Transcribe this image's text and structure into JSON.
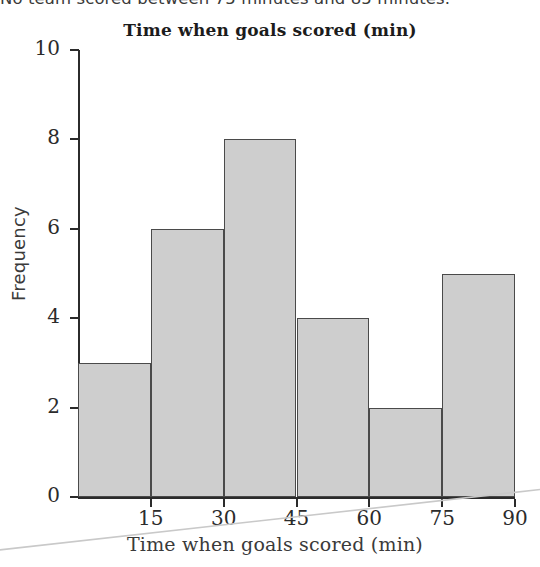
{
  "page": {
    "top_sentence": "No team scored between 75 minutes and 85 minutes."
  },
  "chart_data": {
    "type": "bar",
    "title": "Time when goals scored (min)",
    "xlabel": "Time when goals scored (min)",
    "ylabel": "Frequency",
    "categories": [
      "0-15",
      "15-30",
      "30-45",
      "45-60",
      "60-75",
      "75-90"
    ],
    "bin_edges": [
      0,
      15,
      30,
      45,
      60,
      75,
      90
    ],
    "values": [
      3,
      6,
      8,
      4,
      2,
      5
    ],
    "xtick_labels": [
      "15",
      "30",
      "45",
      "60",
      "75",
      "90"
    ],
    "xtick_values": [
      15,
      30,
      45,
      60,
      75,
      90
    ],
    "ytick_labels": [
      "0",
      "2",
      "4",
      "6",
      "8",
      "10"
    ],
    "ytick_values": [
      0,
      2,
      4,
      6,
      8,
      10
    ],
    "xlim": [
      0,
      90
    ],
    "ylim": [
      0,
      10
    ],
    "grid": false,
    "legend": false,
    "bar_fill_color": "#cecece",
    "bar_edge_color": "#4a4a4a",
    "axis_color": "#2b2b2b"
  }
}
